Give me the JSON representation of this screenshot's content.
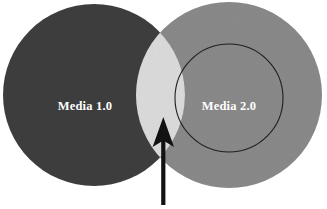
{
  "diagram": {
    "type": "venn",
    "title": "",
    "background_color": "#ffffff",
    "sets": [
      {
        "id": "media-1",
        "label": "Media 1.0",
        "fill_color": "#3f3f3f",
        "label_color": "#ffffff",
        "cx": 94,
        "cy": 95,
        "r": 91
      },
      {
        "id": "media-2",
        "label": "Media 2.0",
        "fill_color": "#8a8a8a",
        "label_color": "#ffffff",
        "cx": 229,
        "cy": 95,
        "r": 93
      }
    ],
    "inner_circle": {
      "id": "media-2-inner",
      "stroke_color": "#1f1f1f",
      "cx": 229,
      "cy": 98,
      "r": 54
    },
    "intersection": {
      "id": "overlap-region",
      "fill_color": "#dcdcdc",
      "label": ""
    },
    "annotation": {
      "id": "overlap-pointer",
      "kind": "arrow",
      "direction": "up",
      "color": "#121212",
      "caption": ""
    }
  }
}
